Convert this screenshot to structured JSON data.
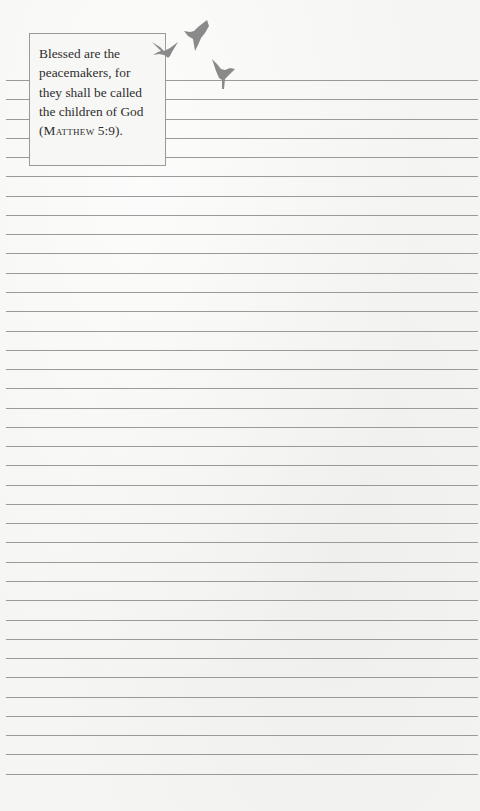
{
  "verse": {
    "lines": [
      "Blessed are the",
      "peacemakers, for",
      "they shall be called",
      "the children of God"
    ],
    "citation_open": "(",
    "citation_book": "Matthew",
    "citation_ref": " 5:9",
    "citation_close": ")."
  },
  "decoration": {
    "birds": [
      "bird-1",
      "bird-2",
      "bird-3"
    ],
    "bird_color": "#8a8a8a"
  },
  "ruled_lines": {
    "count": 37,
    "first_y": 80,
    "spacing": 19.27,
    "color": "#9a9a9a"
  }
}
